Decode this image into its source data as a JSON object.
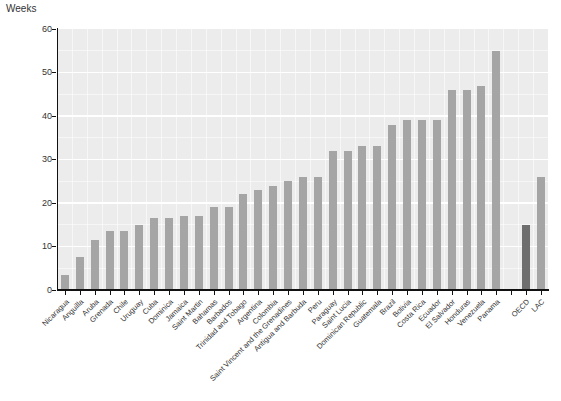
{
  "chart_data": {
    "type": "bar",
    "title": "",
    "unit_label": "Weeks",
    "xlabel": "",
    "ylabel": "Weeks",
    "ylim": [
      0,
      60
    ],
    "yticks": [
      0,
      10,
      20,
      30,
      40,
      50,
      60
    ],
    "grid": "on",
    "legend": "none",
    "bars": [
      {
        "label": "Nicaragua",
        "value": 3.5
      },
      {
        "label": "Anguilla",
        "value": 7.5
      },
      {
        "label": "Aruba",
        "value": 11.5
      },
      {
        "label": "Grenada",
        "value": 13.5
      },
      {
        "label": "Chile",
        "value": 13.5
      },
      {
        "label": "Uruguay",
        "value": 15
      },
      {
        "label": "Cuba",
        "value": 16.5
      },
      {
        "label": "Dominica",
        "value": 16.5
      },
      {
        "label": "Jamaica",
        "value": 17
      },
      {
        "label": "Saint Martin",
        "value": 17
      },
      {
        "label": "Bahamas",
        "value": 19
      },
      {
        "label": "Barbados",
        "value": 19
      },
      {
        "label": "Trinidad and Tobago",
        "value": 22
      },
      {
        "label": "Argentina",
        "value": 23
      },
      {
        "label": "Colombia",
        "value": 24
      },
      {
        "label": "Saint Vincent and the Grenadines",
        "value": 25
      },
      {
        "label": "Antigua and Barbuda",
        "value": 26
      },
      {
        "label": "Peru",
        "value": 26
      },
      {
        "label": "Paraguay",
        "value": 32
      },
      {
        "label": "Saint Lucia",
        "value": 32
      },
      {
        "label": "Dominican Republic",
        "value": 33
      },
      {
        "label": "Guatemala",
        "value": 33
      },
      {
        "label": "Brazil",
        "value": 38
      },
      {
        "label": "Bolivia",
        "value": 39
      },
      {
        "label": "Costa Rica",
        "value": 39
      },
      {
        "label": "Ecuador",
        "value": 39
      },
      {
        "label": "El Salvador",
        "value": 46
      },
      {
        "label": "Honduras",
        "value": 46
      },
      {
        "label": "Venezuela",
        "value": 47
      },
      {
        "label": "Panama",
        "value": 55
      },
      {
        "label": "",
        "value": null,
        "spacer": true
      },
      {
        "label": "OECD",
        "value": 15,
        "highlight": true
      },
      {
        "label": "LAC",
        "value": 26
      }
    ],
    "colors": {
      "bar": "#a5a5a5",
      "highlight_bar": "#6e6e6e",
      "panel": "#ececec",
      "gridline": "#ffffff",
      "axis": "#111111",
      "text": "#333333"
    }
  }
}
